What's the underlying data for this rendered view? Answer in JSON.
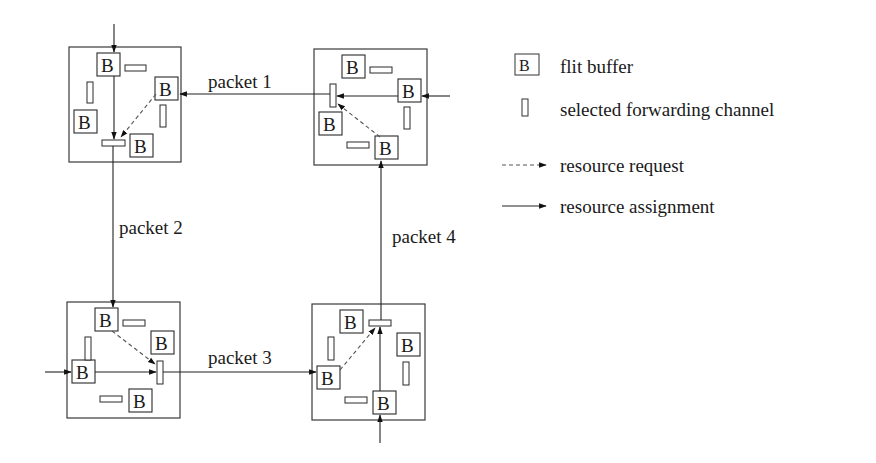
{
  "legend": {
    "items": [
      {
        "icon": "flit-buffer-icon",
        "icon_text": "B",
        "label": "flit buffer"
      },
      {
        "icon": "forwarding-channel-icon",
        "label": "selected forwarding channel"
      },
      {
        "icon": "dashed-arrow-icon",
        "label": "resource request"
      },
      {
        "icon": "solid-arrow-icon",
        "label": "resource assignment"
      }
    ]
  },
  "buffer_label": "B",
  "packets": [
    {
      "id": 1,
      "label": "packet 1"
    },
    {
      "id": 2,
      "label": "packet 2"
    },
    {
      "id": 3,
      "label": "packet 3"
    },
    {
      "id": 4,
      "label": "packet 4"
    }
  ],
  "routers": [
    {
      "name": "router-top-left",
      "x": 69,
      "y": 47,
      "w": 112,
      "h": 115
    },
    {
      "name": "router-top-right",
      "x": 314,
      "y": 49,
      "w": 113,
      "h": 116
    },
    {
      "name": "router-bottom-left",
      "x": 67,
      "y": 302,
      "w": 113,
      "h": 116
    },
    {
      "name": "router-bottom-right",
      "x": 312,
      "y": 304,
      "w": 113,
      "h": 116
    }
  ],
  "colors": {
    "line": "#222222",
    "dashed": "#555555",
    "background": "#ffffff"
  }
}
